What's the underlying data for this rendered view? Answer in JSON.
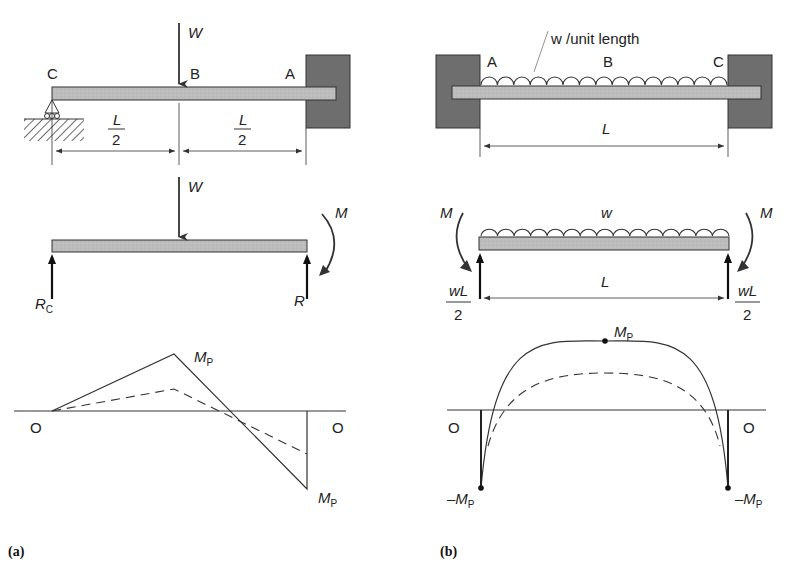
{
  "figure": {
    "panel_a": {
      "label": "(a)",
      "top": {
        "load": "W",
        "points": {
          "c": "C",
          "b": "B",
          "a": "A"
        },
        "dim_left": {
          "num": "L",
          "den": "2"
        },
        "dim_right": {
          "num": "L",
          "den": "2"
        }
      },
      "free_body": {
        "load": "W",
        "moment": "M",
        "reaction_left": "R",
        "reaction_left_sub": "C",
        "reaction_right": "R"
      },
      "moment_diagram": {
        "origin_left": "O",
        "origin_right": "O",
        "peak_label": "M",
        "peak_sub": "P",
        "end_label": "M",
        "end_sub": "P"
      }
    },
    "panel_b": {
      "label": "(b)",
      "top": {
        "load_label": "w /unit length",
        "points": {
          "a": "A",
          "b": "B",
          "c": "C"
        },
        "span": "L"
      },
      "free_body": {
        "load": "w",
        "moment_left": "M",
        "moment_right": "M",
        "span": "L",
        "reaction_left": {
          "num": "wL",
          "den": "2"
        },
        "reaction_right": {
          "num": "wL",
          "den": "2"
        }
      },
      "moment_diagram": {
        "origin_left": "O",
        "origin_right": "O",
        "peak_label": "M",
        "peak_sub": "P",
        "end_left_label": "–M",
        "end_left_sub": "P",
        "end_right_label": "–M",
        "end_right_sub": "P"
      }
    }
  },
  "colors": {
    "beam_fill": "#b8b8b8",
    "wall_fill": "#6e6e6e",
    "line": "#333333"
  }
}
